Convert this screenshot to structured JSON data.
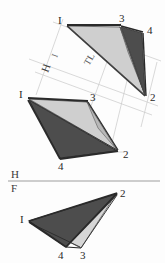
{
  "figure": {
    "background_color": "#fdfdfd",
    "ink_color": "#2a2a2a",
    "light_face_color": "#c8c8c8",
    "mid_face_color": "#8f8f8f",
    "dark_face_color": "#4a4a4a",
    "construction_color": "#c4c4c4",
    "foldline_color": "#bdbdbd"
  },
  "views": {
    "auxiliary": {
      "name": "auxiliary-view",
      "vertex_labels": [
        {
          "id": "1",
          "text": "I",
          "x": 58,
          "y": 22
        },
        {
          "id": "3",
          "text": "3",
          "x": 122,
          "y": 22
        },
        {
          "id": "4",
          "text": "4",
          "x": 146,
          "y": 32
        },
        {
          "id": "2",
          "text": "2",
          "x": 152,
          "y": 98
        }
      ],
      "true_length_label": {
        "text": "TL",
        "x": 92,
        "y": 62
      },
      "faces": [
        {
          "id": "face-1-3-2",
          "shade": "light",
          "points": "68,27 120,27 146,96"
        },
        {
          "id": "face-3-4-2",
          "shade": "dark",
          "points": "120,27 143,33 146,96"
        },
        {
          "id": "face-1-2-edge",
          "shade": "mid",
          "points": "68,27 146,96 120,27"
        }
      ]
    },
    "horizontal": {
      "name": "horizontal-view",
      "plane_letter": "H",
      "vertex_labels": [
        {
          "id": "1",
          "text": "I",
          "x": 20,
          "y": 95
        },
        {
          "id": "3",
          "text": "3",
          "x": 91,
          "y": 100
        },
        {
          "id": "2",
          "text": "2",
          "x": 124,
          "y": 155
        },
        {
          "id": "4",
          "text": "4",
          "x": 62,
          "y": 166
        }
      ],
      "faces": [
        {
          "id": "face-1-3-2",
          "shade": "light",
          "points": "29,100 87,103 117,150"
        },
        {
          "id": "face-1-4-2",
          "shade": "dark",
          "points": "29,100 117,150 60,158"
        }
      ]
    },
    "frontal": {
      "name": "frontal-view",
      "plane_letter": "F",
      "vertex_labels": [
        {
          "id": "2",
          "text": "2",
          "x": 121,
          "y": 192
        },
        {
          "id": "1",
          "text": "I",
          "x": 21,
          "y": 220
        },
        {
          "id": "4",
          "text": "4",
          "x": 60,
          "y": 256
        },
        {
          "id": "3",
          "text": "3",
          "x": 81,
          "y": 256
        }
      ],
      "faces": [
        {
          "id": "face-1-2-3",
          "shade": "light",
          "points": "29,222 116,195 79,247"
        },
        {
          "id": "face-1-2-4",
          "shade": "dark",
          "points": "29,222 116,195 66,246"
        }
      ]
    }
  },
  "fold_line": {
    "name": "H-F-fold-line",
    "upper_letter": "H",
    "lower_letter": "F",
    "upper_letter_pos": {
      "x": 13,
      "y": 175
    },
    "lower_letter_pos": {
      "x": 13,
      "y": 189
    },
    "y": 180,
    "x_start": 8,
    "x_end": 160
  },
  "auxiliary_fold_line": {
    "name": "aux-fold-line",
    "upper_letter": "I",
    "lower_letter": "H",
    "upper_letter_pos": {
      "x": 57,
      "y": 57
    },
    "lower_letter_pos": {
      "x": 50,
      "y": 71
    }
  },
  "construction_lines": [
    {
      "id": "cl-1",
      "x1": 36,
      "y1": 93,
      "x2": 62,
      "y2": 20
    },
    {
      "id": "cl-2",
      "x1": 110,
      "y1": 140,
      "x2": 136,
      "y2": 36
    },
    {
      "id": "cl-3",
      "x1": 85,
      "y1": 118,
      "x2": 121,
      "y2": 24
    },
    {
      "id": "cl-4",
      "x1": 30,
      "y1": 58,
      "x2": 156,
      "y2": 103
    },
    {
      "id": "cl-5",
      "x1": 36,
      "y1": 70,
      "x2": 150,
      "y2": 112
    },
    {
      "id": "cl-6",
      "x1": 52,
      "y1": 24,
      "x2": 160,
      "y2": 62
    }
  ],
  "legend": {
    "tl_meaning": "TL",
    "h_meaning": "H",
    "f_meaning": "F",
    "i_meaning": "I"
  }
}
